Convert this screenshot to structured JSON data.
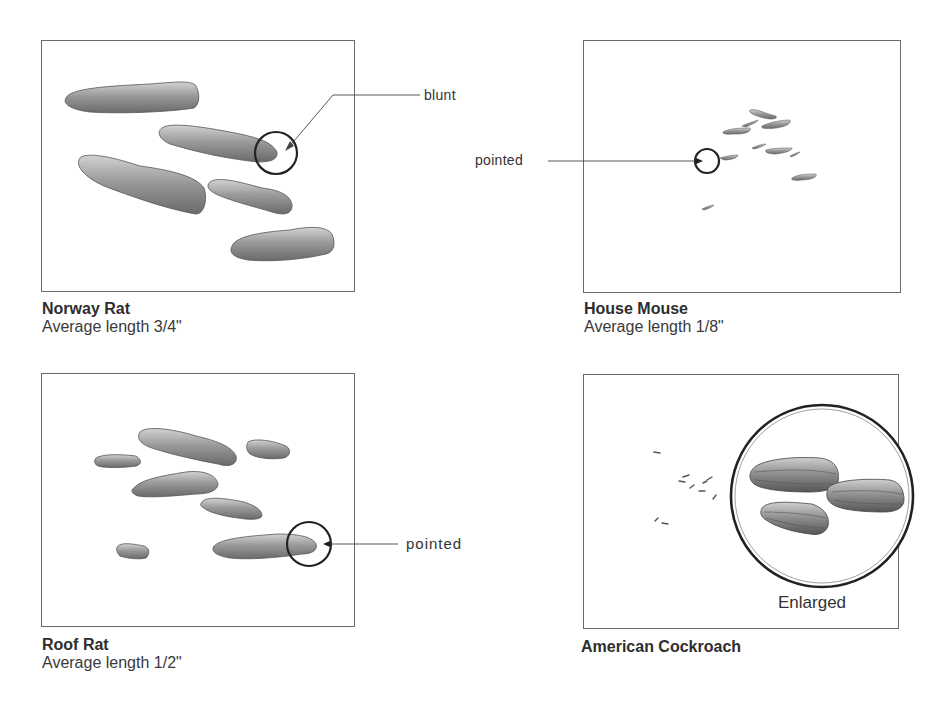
{
  "figure": {
    "panels": [
      {
        "id": "norway-rat",
        "name": "Norway Rat",
        "size_text": "Average length 3/4\"",
        "callout": "blunt"
      },
      {
        "id": "house-mouse",
        "name": "House Mouse",
        "size_text": "Average length 1/8\"",
        "callout": "pointed"
      },
      {
        "id": "roof-rat",
        "name": "Roof Rat",
        "size_text": "Average length 1/2\"",
        "callout": "pointed"
      },
      {
        "id": "american-cockroach",
        "name": "American Cockroach",
        "size_text": "",
        "callout": "",
        "inset_label": "Enlarged"
      }
    ]
  },
  "colors": {
    "border": "#6a6a6a",
    "dropping_fill": "#8f8f8f",
    "dropping_dark": "#4a4a4a",
    "text": "#333333"
  }
}
